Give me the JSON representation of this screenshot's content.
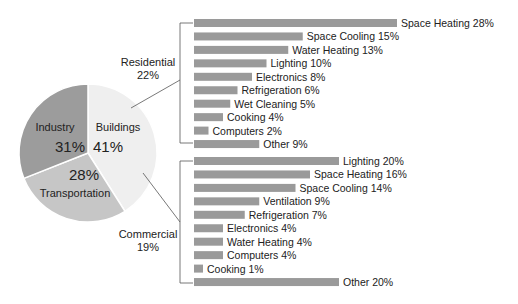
{
  "chart_data": [
    {
      "type": "pie",
      "title": "",
      "slices": [
        {
          "label": "Buildings",
          "value": 41,
          "value_label": "41%",
          "color": "#efefef"
        },
        {
          "label": "Transportation",
          "value": 28,
          "value_label": "28%",
          "color": "#c6c6c6"
        },
        {
          "label": "Industry",
          "value": 31,
          "value_label": "31%",
          "color": "#9c9c9c"
        }
      ]
    },
    {
      "type": "bar",
      "orientation": "horizontal",
      "group": "Residential",
      "group_label": "Residential",
      "group_value": "22%",
      "categories": [
        "Space Heating",
        "Space Cooling",
        "Water Heating",
        "Lighting",
        "Electronics",
        "Refrigeration",
        "Wet Cleaning",
        "Cooking",
        "Computers",
        "Other"
      ],
      "values": [
        28,
        15,
        13,
        10,
        8,
        6,
        5,
        4,
        2,
        9
      ],
      "labels": [
        "Space Heating 28%",
        "Space Cooling 15%",
        "Water Heating 13%",
        "Lighting 10%",
        "Electronics 8%",
        "Refrigeration 6%",
        "Wet Cleaning 5%",
        "Cooking 4%",
        "Computers 2%",
        "Other 9%"
      ],
      "color": "#9a9a9a",
      "grid": false
    },
    {
      "type": "bar",
      "orientation": "horizontal",
      "group": "Commercial",
      "group_label": "Commercial",
      "group_value": "19%",
      "categories": [
        "Lighting",
        "Space Heating",
        "Space Cooling",
        "Ventilation",
        "Refrigeration",
        "Electronics",
        "Water Heating",
        "Computers",
        "Cooking",
        "Other"
      ],
      "values": [
        20,
        16,
        14,
        9,
        7,
        4,
        4,
        4,
        1,
        20
      ],
      "labels": [
        "Lighting 20%",
        "Space Heating 16%",
        "Space Cooling 14%",
        "Ventilation 9%",
        "Refrigeration 7%",
        "Electronics 4%",
        "Water Heating 4%",
        "Computers 4%",
        "Cooking 1%",
        "Other 20%"
      ],
      "color": "#9a9a9a",
      "grid": false
    }
  ],
  "pie": {
    "industry": {
      "name": "Industry",
      "pct": "31%"
    },
    "buildings": {
      "name": "Buildings",
      "pct": "41%"
    },
    "transportation": {
      "name": "Transportation",
      "pct": "28%"
    }
  },
  "residential": {
    "name": "Residential",
    "pct": "22%"
  },
  "commercial": {
    "name": "Commercial",
    "pct": "19%"
  },
  "colors": {
    "industry": "#9c9c9c",
    "transportation": "#c6c6c6",
    "buildings": "#efefef",
    "bar": "#9a9a9a",
    "line": "#555555"
  }
}
